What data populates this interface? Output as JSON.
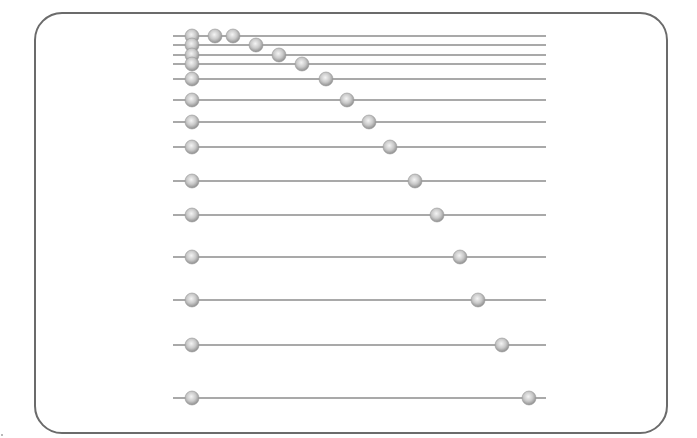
{
  "diagram": {
    "type": "bead-rails",
    "frame": {
      "border_color": "#6b6b6b",
      "corner_radius": 28
    },
    "line_color": "#8c8c8c",
    "bead_color": "#c4c4c4",
    "bead_radius": 7,
    "line_x_start": 173,
    "line_x_end": 546,
    "rows": [
      {
        "y": 36,
        "beads_x": [
          192,
          215,
          233
        ]
      },
      {
        "y": 45,
        "beads_x": [
          192,
          256
        ]
      },
      {
        "y": 55,
        "beads_x": [
          192,
          279
        ]
      },
      {
        "y": 64,
        "beads_x": [
          192,
          302
        ]
      },
      {
        "y": 79,
        "beads_x": [
          192,
          326
        ]
      },
      {
        "y": 100,
        "beads_x": [
          192,
          347
        ]
      },
      {
        "y": 122,
        "beads_x": [
          192,
          369
        ]
      },
      {
        "y": 147,
        "beads_x": [
          192,
          390
        ]
      },
      {
        "y": 181,
        "beads_x": [
          192,
          415
        ]
      },
      {
        "y": 215,
        "beads_x": [
          192,
          437
        ]
      },
      {
        "y": 257,
        "beads_x": [
          192,
          460
        ]
      },
      {
        "y": 300,
        "beads_x": [
          192,
          478
        ]
      },
      {
        "y": 345,
        "beads_x": [
          192,
          502
        ]
      },
      {
        "y": 398,
        "beads_x": [
          192,
          529
        ]
      }
    ]
  }
}
